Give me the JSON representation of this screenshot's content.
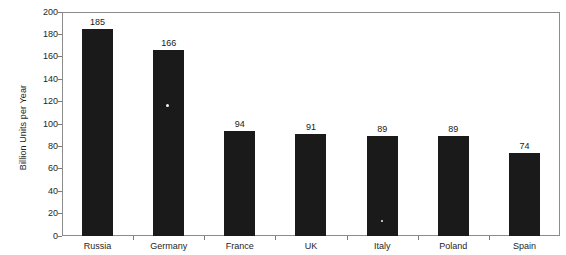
{
  "chart_data": {
    "type": "bar",
    "title": "",
    "subtitle": "",
    "xlabel": "",
    "ylabel": "Billion Units per Year",
    "categories": [
      "Russia",
      "Germany",
      "France",
      "UK",
      "Italy",
      "Poland",
      "Spain"
    ],
    "values": [
      185,
      166,
      94,
      91,
      89,
      89,
      74
    ],
    "data_labels": [
      "185",
      "166",
      "94",
      "91",
      "89",
      "89",
      "74"
    ],
    "ylim": [
      0,
      200
    ],
    "y_ticks": [
      200,
      180,
      160,
      140,
      120,
      100,
      80,
      60,
      40,
      20,
      0
    ],
    "y_tick_labels": [
      "200",
      "180",
      "160",
      "140",
      "120",
      "100",
      "80",
      "60",
      "40",
      "20",
      "0"
    ],
    "grid": false,
    "legend": false,
    "legend_position": "none",
    "bar_color": "#1a1a1a",
    "background_color": "#ffffff",
    "frame_color": "#8c8c8c",
    "orientation": "vertical"
  }
}
